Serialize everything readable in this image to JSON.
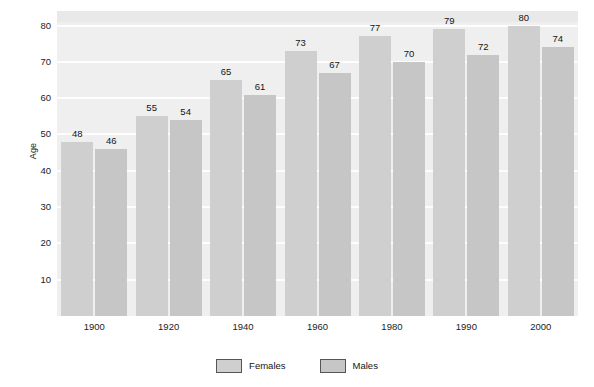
{
  "chart_data": {
    "type": "bar",
    "title": "",
    "subtitle": "",
    "xlabel": "",
    "ylabel": "Age",
    "categories": [
      "1900",
      "1920",
      "1940",
      "1960",
      "1980",
      "1990",
      "2000"
    ],
    "series": [
      {
        "name": "Females",
        "values": [
          48,
          55,
          65,
          73,
          77,
          79,
          80
        ],
        "color": "#cfcfcf"
      },
      {
        "name": "Males",
        "values": [
          46,
          54,
          61,
          67,
          70,
          72,
          74
        ],
        "color": "#c6c6c6"
      }
    ],
    "ylim": [
      0,
      84
    ],
    "y_ticks": [
      10,
      20,
      30,
      40,
      50,
      60,
      70,
      80
    ],
    "y_tick_labels": [
      "10",
      "20",
      "30",
      "40",
      "50",
      "60",
      "70",
      "80"
    ],
    "grid": true,
    "grid_axis": "y",
    "legend_position": "bottom",
    "data_labels": true,
    "plot_background": "#efefef",
    "gridline_color": "#fdfdfd",
    "page_background": "#ffffff"
  },
  "legend": {
    "entries": [
      {
        "label": "Females"
      },
      {
        "label": "Males"
      }
    ]
  }
}
